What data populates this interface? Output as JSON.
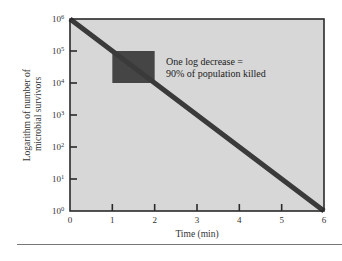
{
  "chart_data": {
    "type": "line",
    "title": "",
    "xlabel": "Time (min)",
    "ylabel": "Logarithm of number of microbial survivors",
    "ylabel_lines": [
      "Logarithm of number of",
      "microbial survivors"
    ],
    "xlim": [
      0,
      6
    ],
    "ylim_log10": [
      0,
      6
    ],
    "yscale": "log",
    "x_ticks": [
      "0",
      "1",
      "2",
      "3",
      "4",
      "5",
      "6"
    ],
    "y_ticks": [
      {
        "base": "10",
        "exp": "0"
      },
      {
        "base": "10",
        "exp": "1"
      },
      {
        "base": "10",
        "exp": "2"
      },
      {
        "base": "10",
        "exp": "3"
      },
      {
        "base": "10",
        "exp": "4"
      },
      {
        "base": "10",
        "exp": "5"
      },
      {
        "base": "10",
        "exp": "6"
      }
    ],
    "series": [
      {
        "name": "Microbial survivors",
        "x": [
          0,
          1,
          2,
          3,
          4,
          5,
          6
        ],
        "y": [
          1000000,
          100000,
          10000,
          1000,
          100,
          10,
          1
        ],
        "color": "#3a3a3a"
      }
    ],
    "highlight_box": {
      "x_range": [
        1,
        2
      ],
      "y_range": [
        10000,
        100000
      ],
      "color": "#454545"
    },
    "annotations": [
      {
        "text_lines": [
          "One log decrease =",
          "90% of population killed"
        ],
        "x": 2.2,
        "y": 30000
      }
    ],
    "grid": false,
    "legend": null,
    "background_color": "#d7d7d7"
  }
}
